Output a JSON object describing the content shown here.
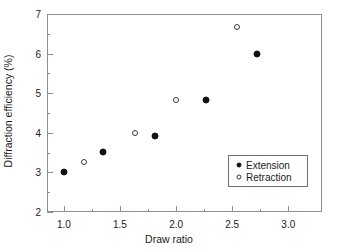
{
  "chart_data": {
    "type": "scatter",
    "title": "",
    "xlabel": "Draw ratio",
    "ylabel": "Diffraction efficiency (%)",
    "xlim": [
      0.85,
      3.3
    ],
    "ylim": [
      2,
      7
    ],
    "grid": false,
    "legend_position": "lower-right",
    "x_ticks_major": [
      "1.0",
      "1.5",
      "2.0",
      "2.5",
      "3.0"
    ],
    "x_ticks_major_values": [
      1.0,
      1.5,
      2.0,
      2.5,
      3.0
    ],
    "x_ticks_minor_values": [
      1.25,
      1.75,
      2.25,
      2.75
    ],
    "y_ticks_major": [
      "2",
      "3",
      "4",
      "5",
      "6",
      "7"
    ],
    "y_ticks_major_values": [
      2,
      3,
      4,
      5,
      6,
      7
    ],
    "y_ticks_minor_values": [
      2.5,
      3.5,
      4.5,
      5.5,
      6.5
    ],
    "series": [
      {
        "name": "Extension",
        "marker": "filled-circle",
        "color": "#111111",
        "points": [
          {
            "x": 1.0,
            "y": 3.01
          },
          {
            "x": 1.35,
            "y": 3.51
          },
          {
            "x": 1.81,
            "y": 3.92
          },
          {
            "x": 2.27,
            "y": 4.84
          },
          {
            "x": 2.72,
            "y": 6.0
          }
        ]
      },
      {
        "name": "Retraction",
        "marker": "open-circle",
        "color": "#3a3a3a",
        "points": [
          {
            "x": 1.18,
            "y": 3.26
          },
          {
            "x": 1.63,
            "y": 3.99
          },
          {
            "x": 2.0,
            "y": 4.83
          },
          {
            "x": 2.54,
            "y": 6.68
          }
        ]
      }
    ]
  },
  "legend": {
    "entries": [
      {
        "label": "Extension"
      },
      {
        "label": "Retraction"
      }
    ]
  }
}
